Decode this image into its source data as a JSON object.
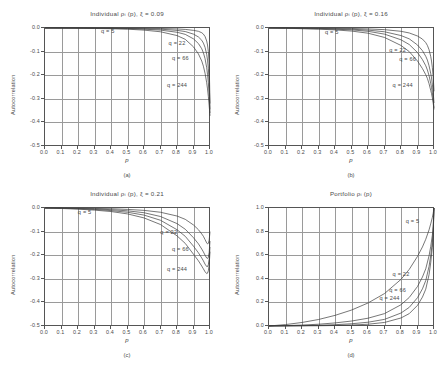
{
  "figure": {
    "xlabel": "p",
    "ylabel": "Autocorrelation",
    "q_values": [
      5,
      22,
      66,
      244
    ]
  },
  "panels": [
    {
      "caption": "(a)",
      "title": "Individual ρᵢ (p), ξ = 0.09",
      "xticks": [
        "0.0",
        "0.1",
        "0.2",
        "0.3",
        "0.4",
        "0.5",
        "0.6",
        "0.7",
        "0.8",
        "0.9",
        "1.0"
      ],
      "yticks": [
        "0.0",
        "-0.1",
        "-0.2",
        "-0.3",
        "-0.4",
        "-0.5"
      ],
      "labels": [
        {
          "text": "q = 5",
          "x": 0.345,
          "y": -0.018
        },
        {
          "text": "q = 22",
          "x": 0.755,
          "y": -0.068
        },
        {
          "text": "q = 66",
          "x": 0.775,
          "y": -0.133
        },
        {
          "text": "q = 244",
          "x": 0.745,
          "y": -0.245
        }
      ]
    },
    {
      "caption": "(b)",
      "title": "Individual ρᵢ (p), ξ = 0.16",
      "xticks": [
        "0.0",
        "0.1",
        "0.2",
        "0.3",
        "0.4",
        "0.5",
        "0.6",
        "0.7",
        "0.8",
        "0.9",
        "1.0"
      ],
      "yticks": [
        "0.0",
        "-0.1",
        "-0.2",
        "-0.3",
        "-0.4",
        "-0.5"
      ],
      "labels": [
        {
          "text": "q = 5",
          "x": 0.345,
          "y": -0.022
        },
        {
          "text": "q = 22",
          "x": 0.735,
          "y": -0.098
        },
        {
          "text": "q = 66",
          "x": 0.795,
          "y": -0.135
        },
        {
          "text": "q = 244",
          "x": 0.755,
          "y": -0.245
        }
      ]
    },
    {
      "caption": "(c)",
      "title": "Individual ρᵢ (p), ξ = 0.21",
      "xticks": [
        "0.0",
        "0.1",
        "0.2",
        "0.3",
        "0.4",
        "0.5",
        "0.6",
        "0.7",
        "0.8",
        "0.9",
        "1.0"
      ],
      "yticks": [
        "0.0",
        "-0.1",
        "-0.2",
        "-0.3",
        "-0.4",
        "-0.5"
      ],
      "labels": [
        {
          "text": "q = 5",
          "x": 0.205,
          "y": -0.022
        },
        {
          "text": "q = 22",
          "x": 0.705,
          "y": -0.108
        },
        {
          "text": "q = 66",
          "x": 0.775,
          "y": -0.178
        },
        {
          "text": "q = 244",
          "x": 0.745,
          "y": -0.262
        }
      ]
    },
    {
      "caption": "(d)",
      "title": "Portfolio ρᵢ (p)",
      "xticks": [
        "0.0",
        "0.1",
        "0.2",
        "0.3",
        "0.4",
        "0.5",
        "0.6",
        "0.7",
        "0.8",
        "0.9",
        "1.0"
      ],
      "yticks": [
        "1.0",
        "0.8",
        "0.6",
        "0.4",
        "0.2",
        "0.0"
      ],
      "labels": [
        {
          "text": "q = 5",
          "x": 0.835,
          "y": 0.885
        },
        {
          "text": "q = 22",
          "x": 0.755,
          "y": 0.435
        },
        {
          "text": "q = 66",
          "x": 0.735,
          "y": 0.3
        },
        {
          "text": "q = 244",
          "x": 0.675,
          "y": 0.225
        }
      ]
    }
  ],
  "chart_data": {
    "type": "line",
    "xlabel": "p",
    "ylabel": "Autocorrelation",
    "xlim": [
      0.0,
      1.0
    ],
    "grid": true,
    "legend_position": "inline-annotations",
    "subplots": [
      {
        "caption": "(a)",
        "title": "Individual ρᵢ (p), ξ = 0.09",
        "xi": 0.09,
        "ylim": [
          -0.5,
          0.0
        ],
        "x": [
          0.0,
          0.1,
          0.2,
          0.3,
          0.4,
          0.5,
          0.6,
          0.7,
          0.8,
          0.85,
          0.9,
          0.93,
          0.95,
          0.96,
          0.97,
          0.98,
          0.985,
          0.99,
          0.995,
          1.0
        ],
        "series": [
          {
            "name": "q = 5",
            "values": [
              0.0,
              0.0,
              0.0,
              0.0,
              0.0,
              -0.001,
              -0.001,
              -0.002,
              -0.004,
              -0.006,
              -0.01,
              -0.014,
              -0.02,
              -0.026,
              -0.036,
              -0.055,
              -0.072,
              -0.1,
              -0.15,
              -0.32
            ]
          },
          {
            "name": "q = 22",
            "values": [
              0.0,
              0.0,
              0.0,
              -0.001,
              -0.001,
              -0.002,
              -0.003,
              -0.005,
              -0.01,
              -0.015,
              -0.026,
              -0.038,
              -0.052,
              -0.064,
              -0.082,
              -0.112,
              -0.136,
              -0.172,
              -0.228,
              -0.345
            ]
          },
          {
            "name": "q = 66",
            "values": [
              0.0,
              0.0,
              -0.001,
              -0.001,
              -0.002,
              -0.003,
              -0.005,
              -0.009,
              -0.018,
              -0.027,
              -0.046,
              -0.066,
              -0.088,
              -0.105,
              -0.13,
              -0.168,
              -0.196,
              -0.232,
              -0.286,
              -0.36
            ]
          },
          {
            "name": "q = 244",
            "values": [
              0.0,
              -0.001,
              -0.001,
              -0.002,
              -0.003,
              -0.005,
              -0.009,
              -0.016,
              -0.032,
              -0.048,
              -0.08,
              -0.11,
              -0.14,
              -0.162,
              -0.192,
              -0.232,
              -0.258,
              -0.29,
              -0.33,
              -0.372
            ]
          }
        ]
      },
      {
        "caption": "(b)",
        "title": "Individual ρᵢ (p), ξ = 0.16",
        "xi": 0.16,
        "ylim": [
          -0.5,
          0.0
        ],
        "x": [
          0.0,
          0.1,
          0.2,
          0.3,
          0.4,
          0.5,
          0.6,
          0.7,
          0.8,
          0.85,
          0.9,
          0.93,
          0.95,
          0.96,
          0.97,
          0.98,
          0.985,
          0.99,
          0.995,
          1.0
        ],
        "series": [
          {
            "name": "q = 5",
            "values": [
              0.0,
              0.0,
              0.0,
              -0.001,
              -0.001,
              -0.002,
              -0.004,
              -0.007,
              -0.014,
              -0.021,
              -0.034,
              -0.047,
              -0.062,
              -0.074,
              -0.092,
              -0.12,
              -0.14,
              -0.168,
              -0.206,
              -0.268
            ]
          },
          {
            "name": "q = 22",
            "values": [
              0.0,
              0.0,
              -0.001,
              -0.002,
              -0.003,
              -0.005,
              -0.009,
              -0.016,
              -0.032,
              -0.046,
              -0.072,
              -0.096,
              -0.12,
              -0.136,
              -0.16,
              -0.192,
              -0.212,
              -0.238,
              -0.272,
              -0.318
            ]
          },
          {
            "name": "q = 66",
            "values": [
              0.0,
              -0.001,
              -0.002,
              -0.003,
              -0.005,
              -0.008,
              -0.014,
              -0.026,
              -0.05,
              -0.07,
              -0.104,
              -0.134,
              -0.16,
              -0.178,
              -0.202,
              -0.234,
              -0.252,
              -0.274,
              -0.302,
              -0.338
            ]
          },
          {
            "name": "q = 244",
            "values": [
              0.0,
              -0.001,
              -0.003,
              -0.005,
              -0.008,
              -0.013,
              -0.022,
              -0.04,
              -0.074,
              -0.1,
              -0.14,
              -0.172,
              -0.198,
              -0.214,
              -0.236,
              -0.264,
              -0.278,
              -0.296,
              -0.318,
              -0.345
            ]
          }
        ]
      },
      {
        "caption": "(c)",
        "title": "Individual ρᵢ (p), ξ = 0.21",
        "xi": 0.21,
        "ylim": [
          -0.5,
          0.0
        ],
        "x": [
          0.0,
          0.1,
          0.2,
          0.3,
          0.4,
          0.5,
          0.6,
          0.7,
          0.8,
          0.85,
          0.9,
          0.93,
          0.95,
          0.96,
          0.97,
          0.98,
          0.985,
          0.99,
          0.995,
          1.0
        ],
        "series": [
          {
            "name": "q = 5",
            "values": [
              0.0,
              0.0,
              -0.001,
              -0.002,
              -0.003,
              -0.006,
              -0.01,
              -0.018,
              -0.034,
              -0.048,
              -0.072,
              -0.092,
              -0.11,
              -0.12,
              -0.134,
              -0.148,
              -0.152,
              -0.15,
              -0.136,
              -0.1
            ]
          },
          {
            "name": "q = 22",
            "values": [
              0.0,
              -0.001,
              -0.002,
              -0.004,
              -0.007,
              -0.012,
              -0.02,
              -0.036,
              -0.066,
              -0.09,
              -0.126,
              -0.152,
              -0.174,
              -0.186,
              -0.2,
              -0.212,
              -0.214,
              -0.208,
              -0.188,
              -0.14
            ]
          },
          {
            "name": "q = 66",
            "values": [
              0.0,
              -0.001,
              -0.003,
              -0.006,
              -0.011,
              -0.018,
              -0.03,
              -0.052,
              -0.092,
              -0.12,
              -0.162,
              -0.19,
              -0.212,
              -0.224,
              -0.238,
              -0.248,
              -0.248,
              -0.24,
              -0.216,
              -0.165
            ]
          },
          {
            "name": "q = 244",
            "values": [
              0.0,
              -0.002,
              -0.005,
              -0.009,
              -0.015,
              -0.025,
              -0.042,
              -0.07,
              -0.118,
              -0.15,
              -0.196,
              -0.224,
              -0.246,
              -0.258,
              -0.27,
              -0.278,
              -0.276,
              -0.266,
              -0.24,
              -0.185
            ]
          }
        ]
      },
      {
        "caption": "(d)",
        "title": "Portfolio ρᵢ (p)",
        "ylim": [
          0.0,
          1.0
        ],
        "x": [
          0.0,
          0.1,
          0.2,
          0.3,
          0.4,
          0.5,
          0.6,
          0.7,
          0.8,
          0.85,
          0.9,
          0.93,
          0.95,
          0.97,
          0.98,
          0.99,
          0.995,
          1.0
        ],
        "series": [
          {
            "name": "q = 5",
            "values": [
              0.0,
              0.012,
              0.03,
              0.055,
              0.09,
              0.135,
              0.195,
              0.275,
              0.395,
              0.48,
              0.59,
              0.67,
              0.735,
              0.815,
              0.865,
              0.92,
              0.955,
              1.0
            ]
          },
          {
            "name": "q = 22",
            "values": [
              0.0,
              0.003,
              0.008,
              0.015,
              0.026,
              0.042,
              0.066,
              0.105,
              0.18,
              0.242,
              0.335,
              0.415,
              0.485,
              0.595,
              0.672,
              0.77,
              0.845,
              1.0
            ]
          },
          {
            "name": "q = 66",
            "values": [
              0.0,
              0.001,
              0.003,
              0.006,
              0.011,
              0.019,
              0.032,
              0.056,
              0.11,
              0.158,
              0.24,
              0.315,
              0.385,
              0.505,
              0.595,
              0.71,
              0.805,
              1.0
            ]
          },
          {
            "name": "q = 244",
            "values": [
              0.0,
              0.0,
              0.001,
              0.002,
              0.004,
              0.008,
              0.015,
              0.03,
              0.068,
              0.105,
              0.175,
              0.245,
              0.312,
              0.435,
              0.535,
              0.665,
              0.775,
              1.0
            ]
          }
        ]
      }
    ]
  }
}
